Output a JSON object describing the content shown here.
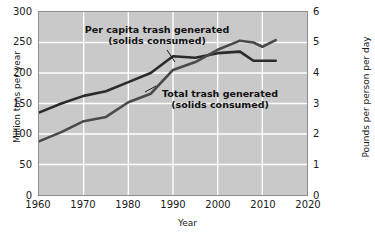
{
  "chart_data": {
    "type": "line",
    "title": "",
    "xlabel": "Year",
    "ylabel": "Million tons per year",
    "ylabel_right": "Pounds per person per day",
    "xlim": [
      1960,
      2020
    ],
    "ylim": [
      0,
      300
    ],
    "ylim_right": [
      0,
      6
    ],
    "grid": true,
    "legend_position": "inline-annotations",
    "xticks": [
      "1960",
      "1970",
      "1980",
      "1990",
      "2000",
      "2010",
      "2020"
    ],
    "yticks_left": [
      "0",
      "50",
      "100",
      "150",
      "200",
      "250",
      "300"
    ],
    "yticks_right": [
      "0",
      "1",
      "2",
      "3",
      "4",
      "5",
      "6"
    ],
    "series": [
      {
        "name": "Per capita trash generated (solids consumed)",
        "axis": "right",
        "units": "Pounds per person per day",
        "color": "#2b2b2b",
        "x": [
          1960,
          1965,
          1970,
          1975,
          1980,
          1985,
          1990,
          1995,
          2000,
          2005,
          2008,
          2010,
          2013
        ],
        "values": [
          2.7,
          3.0,
          3.25,
          3.4,
          3.7,
          4.0,
          4.55,
          4.5,
          4.65,
          4.7,
          4.4,
          4.4,
          4.4
        ]
      },
      {
        "name": "Total trash generated (solids consumed)",
        "axis": "left",
        "units": "Million tons per year",
        "color": "#4a4a4a",
        "x": [
          1960,
          1965,
          1970,
          1975,
          1980,
          1985,
          1990,
          1995,
          2000,
          2005,
          2008,
          2010,
          2013
        ],
        "values": [
          88,
          103,
          121,
          128,
          152,
          166,
          205,
          218,
          238,
          253,
          250,
          243,
          254
        ]
      }
    ],
    "annotations": [
      {
        "id": "per-capita",
        "line1": "Per capita trash generated",
        "line2": "(solids consumed)"
      },
      {
        "id": "total",
        "line1": "Total trash generated",
        "line2": "(solids consumed)"
      }
    ]
  }
}
